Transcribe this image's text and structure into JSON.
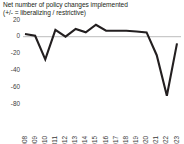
{
  "title": {
    "line1": "Net number of policy changes implemented",
    "line2": "(+/- = liberalizing / restrictive)"
  },
  "colors": {
    "line": "#231f20",
    "zero_line": "#c9c9c9",
    "text": "#231f20",
    "tick_text": "#3b3b3b",
    "background": "#ffffff"
  },
  "chart_data": {
    "type": "line",
    "title": "Net number of policy changes implemented (+/- = liberalizing / restrictive)",
    "xlabel": "",
    "ylabel": "",
    "ylim": [
      -88,
      22
    ],
    "xlim": [
      2008,
      2023
    ],
    "grid": false,
    "legend_position": "none",
    "zero_reference_line": 0,
    "ytick_labels": [
      "20",
      "0",
      "-20",
      "-40",
      "-60",
      "-80"
    ],
    "ytick_values": [
      20,
      0,
      -20,
      -40,
      -60,
      -80
    ],
    "categories": [
      "2008",
      "2009",
      "2010",
      "2011",
      "2012",
      "2013",
      "2014",
      "2015",
      "2016",
      "2017",
      "2018",
      "2019",
      "2020",
      "2021",
      "2022",
      "2023"
    ],
    "series": [
      {
        "name": "Net number of policy changes implemented",
        "values": [
          3,
          1,
          -27,
          8,
          0,
          9,
          5,
          14,
          7,
          7,
          7,
          6,
          5,
          -22,
          -70,
          -8
        ]
      }
    ]
  }
}
